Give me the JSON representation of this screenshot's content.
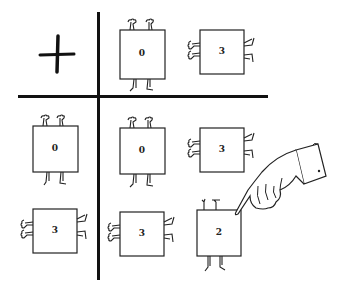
{
  "table": {
    "operator": "+",
    "column_headers": [
      {
        "value": "0",
        "orientation": "upright"
      },
      {
        "value": "3",
        "orientation": "sideways"
      }
    ],
    "row_headers": [
      {
        "value": "0",
        "orientation": "upright"
      },
      {
        "value": "3",
        "orientation": "sideways"
      }
    ],
    "cells": [
      [
        {
          "value": "0",
          "orientation": "upright"
        },
        {
          "value": "3",
          "orientation": "sideways"
        }
      ],
      [
        {
          "value": "3",
          "orientation": "sideways"
        },
        {
          "value": "2",
          "orientation": "upright",
          "pointed_at": true
        }
      ]
    ]
  },
  "pointer": {
    "icon": "pointing-hand-icon",
    "target": "cell-row2-col2"
  },
  "colors": {
    "ink": "#111111",
    "background": "#ffffff"
  }
}
